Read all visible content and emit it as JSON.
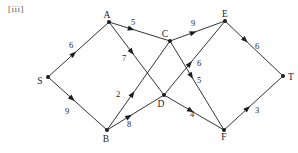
{
  "figure": {
    "label": "[iii]"
  },
  "colors": {
    "ink": "#1d1d1d",
    "background": "#ffffff",
    "figure_label": "#575757"
  },
  "graph": {
    "type": "directed-weighted-network",
    "node_radius": 2,
    "nodes": [
      {
        "id": "S",
        "label": "S",
        "x": 48,
        "y": 77,
        "label_x": 40,
        "label_y": 84
      },
      {
        "id": "A",
        "label": "A",
        "x": 109,
        "y": 22,
        "label_x": 107,
        "label_y": 18
      },
      {
        "id": "B",
        "label": "B",
        "x": 107,
        "y": 130,
        "label_x": 106,
        "label_y": 142
      },
      {
        "id": "C",
        "label": "C",
        "x": 170,
        "y": 41,
        "label_x": 165,
        "label_y": 37
      },
      {
        "id": "D",
        "label": "D",
        "x": 164,
        "y": 95,
        "label_x": 161,
        "label_y": 107
      },
      {
        "id": "E",
        "label": "E",
        "x": 225,
        "y": 21,
        "label_x": 225,
        "label_y": 17
      },
      {
        "id": "F",
        "label": "F",
        "x": 224,
        "y": 130,
        "label_x": 224,
        "label_y": 140
      },
      {
        "id": "T",
        "label": "T",
        "x": 283,
        "y": 76,
        "label_x": 291,
        "label_y": 80
      }
    ],
    "edges": [
      {
        "from": "S",
        "to": "A",
        "weight": 6,
        "label_x": 71,
        "label_y": 48,
        "arrow_t": 0.44
      },
      {
        "from": "S",
        "to": "B",
        "weight": 9,
        "label_x": 67,
        "label_y": 114,
        "arrow_t": 0.43
      },
      {
        "from": "A",
        "to": "C",
        "weight": 5,
        "label_x": 133,
        "label_y": 25,
        "arrow_t": 0.39
      },
      {
        "from": "A",
        "to": "D",
        "weight": 7,
        "label_x": 124,
        "label_y": 61,
        "arrow_t": 0.43
      },
      {
        "from": "B",
        "to": "C",
        "weight": 2,
        "label_x": 118,
        "label_y": 97,
        "arrow_t": 0.42
      },
      {
        "from": "B",
        "to": "D",
        "weight": 8,
        "label_x": 129,
        "label_y": 127,
        "arrow_t": 0.41
      },
      {
        "from": "C",
        "to": "E",
        "weight": 9,
        "label_x": 193,
        "label_y": 26,
        "arrow_t": 0.45
      },
      {
        "from": "C",
        "to": "F",
        "weight": 5,
        "label_x": 199,
        "label_y": 83,
        "arrow_t": 0.41
      },
      {
        "from": "D",
        "to": "E",
        "weight": 6,
        "label_x": 199,
        "label_y": 66,
        "arrow_t": 0.44
      },
      {
        "from": "D",
        "to": "F",
        "weight": 4,
        "label_x": 192,
        "label_y": 117,
        "arrow_t": 0.47
      },
      {
        "from": "E",
        "to": "T",
        "weight": 6,
        "label_x": 257,
        "label_y": 49,
        "arrow_t": 0.37
      },
      {
        "from": "F",
        "to": "T",
        "weight": 3,
        "label_x": 257,
        "label_y": 113,
        "arrow_t": 0.42
      }
    ]
  }
}
